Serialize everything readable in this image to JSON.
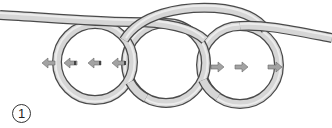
{
  "diagram": {
    "type": "knot-instruction",
    "step_number": "1",
    "rope": {
      "fill_color": "#d6d6d6",
      "edge_color": "#4a4a4a",
      "width": 8
    },
    "loops": [
      {
        "id": "loop-1",
        "cx": 95,
        "cy": 62,
        "r": 38
      },
      {
        "id": "loop-2",
        "cx": 166,
        "cy": 63,
        "r": 40
      },
      {
        "id": "loop-3",
        "cx": 240,
        "cy": 65,
        "r": 39
      }
    ],
    "arrows": [
      {
        "direction": "left",
        "x": 48,
        "y": 63
      },
      {
        "direction": "left",
        "x": 70,
        "y": 63
      },
      {
        "direction": "left",
        "x": 94,
        "y": 63
      },
      {
        "direction": "left",
        "x": 118,
        "y": 63
      },
      {
        "direction": "right",
        "x": 216,
        "y": 67
      },
      {
        "direction": "right",
        "x": 242,
        "y": 67
      },
      {
        "direction": "right",
        "x": 272,
        "y": 67
      }
    ],
    "arrow_color": "#9a9a9a"
  }
}
